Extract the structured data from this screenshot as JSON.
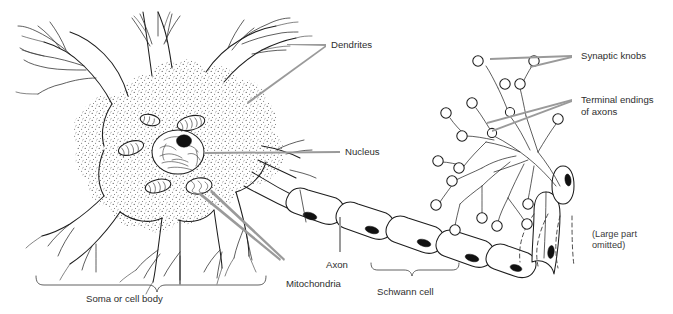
{
  "figure": {
    "background_color": "#ffffff",
    "ink_color": "#1d1d1d",
    "label_color": "#2e2e2e",
    "leader_color": "#8d8d8d"
  },
  "labels": {
    "dendrites": "Dendrites",
    "nucleus": "Nucleus",
    "axon": "Axon",
    "mitochondria": "Mitochondria",
    "schwann_cell": "Schwann cell",
    "soma": "Soma or cell body",
    "synaptic_knobs": "Synaptic knobs",
    "terminal_endings_line1": "Terminal endings",
    "terminal_endings_line2": "of axons",
    "omitted_line1": "(Large part",
    "omitted_line2": "omitted)"
  },
  "parts": {
    "soma": {
      "name": "Soma or cell body",
      "description": "Stippled cytoplasm cell body with radiating processes"
    },
    "nucleus": {
      "name": "Nucleus",
      "description": "Large oval nucleus with chromatin texture and dark nucleolus"
    },
    "mitochondria": {
      "name": "Mitochondria",
      "count": 5,
      "description": "Oval organelles with internal cristae lines"
    },
    "dendrites": {
      "name": "Dendrites",
      "count": 6,
      "description": "Branching tapering processes extending from soma"
    },
    "axon": {
      "name": "Axon",
      "description": "Long process extending from axon hillock to terminals"
    },
    "schwann_cell": {
      "name": "Schwann cell",
      "description": "Myelin sheath segments along axon with dark nuclei",
      "segment_count": 6
    },
    "terminal_endings": {
      "name": "Terminal endings of axons",
      "description": "Branched arborization at axon terminus"
    },
    "synaptic_knobs": {
      "name": "Synaptic knobs",
      "description": "Small bulbs at tips of terminal branches",
      "count": 22
    },
    "omitted_section": {
      "name": "(Large part omitted)",
      "description": "Dashed lines indicating shortened axon length"
    }
  }
}
